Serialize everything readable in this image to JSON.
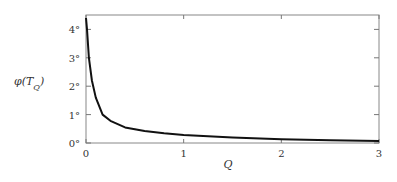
{
  "chart_data": {
    "type": "line",
    "title": "",
    "xlabel": "Q",
    "ylabel": "φ(T_Q)",
    "ylabel_display": "φ(T",
    "ylabel_sub": "Q",
    "xlim": [
      0,
      3
    ],
    "ylim": [
      0,
      4.5
    ],
    "x_ticks": [
      0,
      1,
      2,
      3
    ],
    "x_tick_labels": [
      "0",
      "1",
      "2",
      "3"
    ],
    "y_ticks": [
      0,
      1,
      2,
      3,
      4
    ],
    "y_tick_labels": [
      "0°",
      "1°",
      "2°",
      "3°",
      "4°"
    ],
    "grid": false,
    "legend": null,
    "series": [
      {
        "name": "φ(T_Q)",
        "color": "#111111",
        "x": [
          0.0,
          0.01,
          0.03,
          0.06,
          0.1,
          0.17,
          0.25,
          0.4,
          0.6,
          0.8,
          1.0,
          1.5,
          2.0,
          2.5,
          3.0
        ],
        "y": [
          4.4,
          4.0,
          3.0,
          2.2,
          1.6,
          1.0,
          0.78,
          0.55,
          0.42,
          0.34,
          0.28,
          0.19,
          0.13,
          0.1,
          0.07
        ]
      }
    ]
  }
}
